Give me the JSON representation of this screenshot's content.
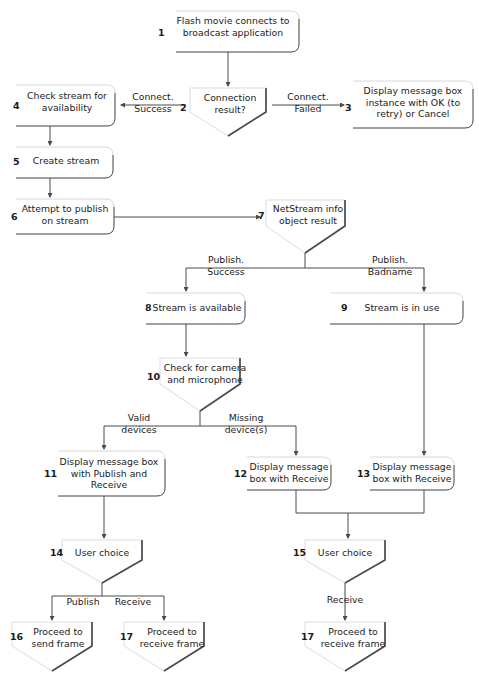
{
  "diagram": {
    "colors": {
      "ink": "#1b1b1b",
      "edge_dark": "#4a4a4a",
      "edge_light": "#d8d8d8",
      "background": "#ffffff"
    },
    "nodes": [
      {
        "num": "1",
        "label": "Flash movie connects to\nbroadcast application",
        "shape": "process"
      },
      {
        "num": "2",
        "label": "Connection\nresult?",
        "shape": "decision"
      },
      {
        "num": "3",
        "label": "Display message box\ninstance with OK (to\nretry) or Cancel",
        "shape": "process"
      },
      {
        "num": "4",
        "label": "Check stream for\navailability",
        "shape": "process"
      },
      {
        "num": "5",
        "label": "Create stream",
        "shape": "process"
      },
      {
        "num": "6",
        "label": "Attempt to publish\non stream",
        "shape": "process"
      },
      {
        "num": "7",
        "label": "NetStream info\nobject result",
        "shape": "decision"
      },
      {
        "num": "8",
        "label": "Stream is available",
        "shape": "process"
      },
      {
        "num": "9",
        "label": "Stream is in use",
        "shape": "process"
      },
      {
        "num": "10",
        "label": "Check for camera\nand microphone",
        "shape": "decision"
      },
      {
        "num": "11",
        "label": "Display message box\nwith Publish and\nReceive",
        "shape": "process"
      },
      {
        "num": "12",
        "label": "Display message\nbox with Receive",
        "shape": "process"
      },
      {
        "num": "13",
        "label": "Display message\nbox with Receive",
        "shape": "process"
      },
      {
        "num": "14",
        "label": "User choice",
        "shape": "decision"
      },
      {
        "num": "15",
        "label": "User choice",
        "shape": "decision"
      },
      {
        "num": "16",
        "label": "Proceed to\nsend frame",
        "shape": "terminal"
      },
      {
        "num": "17",
        "label": "Proceed to\nreceive frame",
        "shape": "terminal"
      },
      {
        "num": "17",
        "label": "Proceed to\nreceive frame",
        "shape": "terminal"
      }
    ],
    "edge_labels": [
      {
        "id": "connect-success",
        "text": "Connect.\nSuccess"
      },
      {
        "id": "connect-failed",
        "text": "Connect.\nFailed"
      },
      {
        "id": "publish-success",
        "text": "Publish.\nSuccess"
      },
      {
        "id": "publish-badname",
        "text": "Publish.\nBadname"
      },
      {
        "id": "valid-devices",
        "text": "Valid\ndevices"
      },
      {
        "id": "missing-devices",
        "text": "Missing\ndevice(s)"
      },
      {
        "id": "publish-choice",
        "text": "Publish"
      },
      {
        "id": "receive-choice",
        "text": "Receive"
      },
      {
        "id": "receive-only",
        "text": "Receive"
      }
    ]
  }
}
